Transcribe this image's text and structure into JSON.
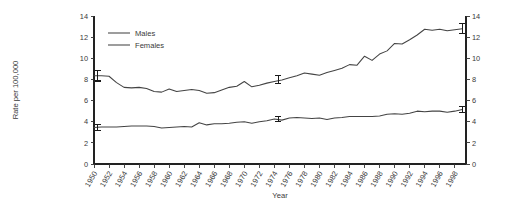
{
  "chart_data": {
    "type": "line",
    "title": "",
    "xlabel": "Year",
    "ylabel": "Rate per 100,000",
    "xlim": [
      1950,
      1999.5
    ],
    "ylim": [
      0,
      14
    ],
    "yticks": [
      0,
      2,
      4,
      6,
      8,
      10,
      12,
      14
    ],
    "ytick_labels": [
      "0",
      "2",
      "4",
      "6",
      "8",
      "10",
      "12",
      "14"
    ],
    "right_axis": true,
    "right_yticks": [
      0,
      2,
      4,
      6,
      8,
      10,
      12,
      14
    ],
    "right_ytick_labels": [
      "0",
      "2",
      "4",
      "6",
      "8",
      "10",
      "12",
      "14"
    ],
    "grid": false,
    "legend_position": "upper-left",
    "xticks": [
      1950,
      1952,
      1954,
      1956,
      1958,
      1960,
      1962,
      1964,
      1966,
      1968,
      1970,
      1972,
      1974,
      1976,
      1978,
      1980,
      1982,
      1984,
      1986,
      1988,
      1990,
      1992,
      1994,
      1996,
      1998
    ],
    "xtick_labels": [
      "1950",
      "1952",
      "1954",
      "1956",
      "1958",
      "1960",
      "1962",
      "1964",
      "1966",
      "1968",
      "1970",
      "1972",
      "1974",
      "1976",
      "1978",
      "1980",
      "1982",
      "1984",
      "1986",
      "1988",
      "1990",
      "1992",
      "1994",
      "1996",
      "1998"
    ],
    "x": [
      1950,
      1951,
      1952,
      1953,
      1954,
      1955,
      1956,
      1957,
      1958,
      1959,
      1960,
      1961,
      1962,
      1963,
      1964,
      1965,
      1966,
      1967,
      1968,
      1969,
      1970,
      1971,
      1972,
      1973,
      1974,
      1975,
      1976,
      1977,
      1978,
      1979,
      1980,
      1981,
      1982,
      1983,
      1984,
      1985,
      1986,
      1987,
      1988,
      1989,
      1990,
      1991,
      1992,
      1993,
      1994,
      1995,
      1996,
      1997,
      1998,
      1999
    ],
    "series": [
      {
        "name": "Males",
        "color": "#444444",
        "values": [
          8.35,
          8.35,
          8.3,
          7.7,
          7.25,
          7.2,
          7.25,
          7.15,
          6.85,
          6.8,
          7.1,
          6.85,
          6.95,
          7.05,
          6.95,
          6.7,
          6.75,
          7.0,
          7.25,
          7.35,
          7.8,
          7.3,
          7.45,
          7.65,
          7.8,
          7.95,
          8.15,
          8.35,
          8.6,
          8.5,
          8.4,
          8.65,
          8.85,
          9.05,
          9.4,
          9.35,
          10.2,
          9.8,
          10.4,
          10.7,
          11.4,
          11.35,
          11.75,
          12.2,
          12.75,
          12.65,
          12.75,
          12.6,
          12.7,
          12.8
        ]
      },
      {
        "name": "Females",
        "color": "#444444",
        "values": [
          3.45,
          3.5,
          3.5,
          3.5,
          3.55,
          3.6,
          3.6,
          3.6,
          3.55,
          3.4,
          3.45,
          3.5,
          3.55,
          3.5,
          3.9,
          3.7,
          3.8,
          3.8,
          3.85,
          3.95,
          4.0,
          3.85,
          4.0,
          4.1,
          4.25,
          4.15,
          4.35,
          4.4,
          4.35,
          4.3,
          4.35,
          4.2,
          4.35,
          4.4,
          4.5,
          4.5,
          4.5,
          4.5,
          4.55,
          4.7,
          4.75,
          4.7,
          4.8,
          5.0,
          4.95,
          5.0,
          5.0,
          4.9,
          5.0,
          5.15
        ]
      }
    ],
    "error_bars": [
      {
        "series": "Males",
        "x": 1950.5,
        "y": 8.35,
        "low": 7.85,
        "high": 8.85
      },
      {
        "series": "Males",
        "x": 1974.5,
        "y": 7.95,
        "low": 7.6,
        "high": 8.35
      },
      {
        "series": "Males",
        "x": 1999.0,
        "y": 12.8,
        "low": 12.35,
        "high": 13.25
      },
      {
        "series": "Females",
        "x": 1950.5,
        "y": 3.45,
        "low": 3.2,
        "high": 3.7
      },
      {
        "series": "Females",
        "x": 1974.5,
        "y": 4.25,
        "low": 4.0,
        "high": 4.5
      },
      {
        "series": "Females",
        "x": 1999.0,
        "y": 5.15,
        "low": 4.9,
        "high": 5.4
      }
    ]
  },
  "legend": {
    "entries": [
      {
        "label": "Males"
      },
      {
        "label": "Females"
      }
    ]
  }
}
